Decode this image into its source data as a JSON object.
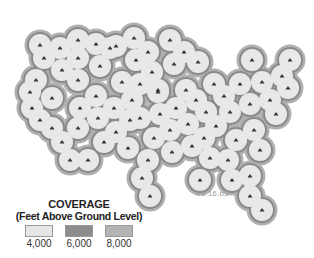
{
  "map": {
    "type": "radar-coverage",
    "region": "Contiguous United States",
    "colors": {
      "ring_6000": "#8a8a8a",
      "ring_8000": "#b0b0b0",
      "fill_4000": "#e8e8e8",
      "marker": "#333333"
    },
    "sites": [
      [
        40,
        45
      ],
      [
        44,
        58
      ],
      [
        36,
        80
      ],
      [
        30,
        92
      ],
      [
        32,
        108
      ],
      [
        40,
        120
      ],
      [
        52,
        128
      ],
      [
        62,
        142
      ],
      [
        52,
        98
      ],
      [
        62,
        70
      ],
      [
        60,
        48
      ],
      [
        78,
        40
      ],
      [
        78,
        58
      ],
      [
        96,
        44
      ],
      [
        110,
        48
      ],
      [
        100,
        66
      ],
      [
        78,
        80
      ],
      [
        96,
        96
      ],
      [
        80,
        108
      ],
      [
        78,
        128
      ],
      [
        98,
        118
      ],
      [
        70,
        160
      ],
      [
        88,
        160
      ],
      [
        116,
        46
      ],
      [
        134,
        38
      ],
      [
        136,
        60
      ],
      [
        148,
        52
      ],
      [
        122,
        82
      ],
      [
        132,
        100
      ],
      [
        140,
        84
      ],
      [
        152,
        72
      ],
      [
        114,
        108
      ],
      [
        116,
        132
      ],
      [
        140,
        118
      ],
      [
        128,
        148
      ],
      [
        104,
        142
      ],
      [
        158,
        92
      ],
      [
        160,
        114
      ],
      [
        154,
        138
      ],
      [
        148,
        160
      ],
      [
        170,
        40
      ],
      [
        184,
        52
      ],
      [
        198,
        62
      ],
      [
        214,
        84
      ],
      [
        174,
        64
      ],
      [
        186,
        90
      ],
      [
        176,
        108
      ],
      [
        196,
        100
      ],
      [
        170,
        130
      ],
      [
        188,
        124
      ],
      [
        172,
        152
      ],
      [
        192,
        146
      ],
      [
        206,
        112
      ],
      [
        224,
        96
      ],
      [
        216,
        126
      ],
      [
        210,
        158
      ],
      [
        230,
        112
      ],
      [
        236,
        140
      ],
      [
        228,
        160
      ],
      [
        250,
        104
      ],
      [
        254,
        130
      ],
      [
        262,
        82
      ],
      [
        270,
        100
      ],
      [
        282,
        76
      ],
      [
        290,
        60
      ],
      [
        288,
        88
      ],
      [
        276,
        114
      ],
      [
        252,
        60
      ],
      [
        260,
        150
      ],
      [
        232,
        180
      ],
      [
        250,
        176
      ],
      [
        250,
        196
      ],
      [
        262,
        210
      ],
      [
        142,
        178
      ],
      [
        150,
        196
      ],
      [
        158,
        90
      ],
      [
        204,
        138
      ],
      [
        240,
        84
      ],
      [
        130,
        120
      ],
      [
        200,
        180
      ]
    ]
  },
  "legend": {
    "title": "COVERAGE",
    "subtitle": "(Feet Above Ground Level)",
    "items": [
      {
        "label": "4,000",
        "color": "#e6e6e6"
      },
      {
        "label": "6,000",
        "color": "#8c8c8c"
      },
      {
        "label": "8,000",
        "color": "#b4b4b4"
      }
    ]
  },
  "graphic_code": "05.16.b3"
}
